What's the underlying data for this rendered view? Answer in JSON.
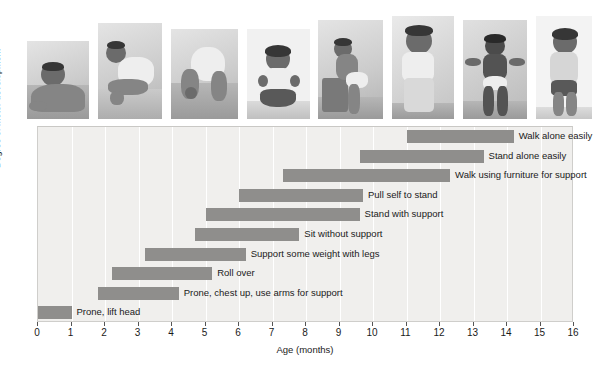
{
  "chart_data": {
    "type": "bar",
    "subtype": "horizontal-range-bar",
    "title": "",
    "xlabel": "Age (months)",
    "ylabel": "Degree of motor development",
    "xlim": [
      0,
      16
    ],
    "xticks": [
      0,
      1,
      2,
      3,
      4,
      5,
      6,
      7,
      8,
      9,
      10,
      11,
      12,
      13,
      14,
      15,
      16
    ],
    "grid": true,
    "legend": "none",
    "bar_color": "#8f8e8c",
    "plot_background": "#f0efed",
    "categories": [
      "Walk alone easily",
      "Stand alone easily",
      "Walk using furniture for support",
      "Pull self to stand",
      "Stand with support",
      "Sit without support",
      "Support some weight with legs",
      "Roll over",
      "Prone, chest up, use arms for support",
      "Prone, lift head"
    ],
    "bars": [
      {
        "label": "Walk alone easily",
        "start": 11.0,
        "end": 14.2
      },
      {
        "label": "Stand alone easily",
        "start": 9.6,
        "end": 13.3
      },
      {
        "label": "Walk using furniture for support",
        "start": 7.3,
        "end": 12.3
      },
      {
        "label": "Pull self to stand",
        "start": 6.0,
        "end": 9.7
      },
      {
        "label": "Stand with support",
        "start": 5.0,
        "end": 9.6
      },
      {
        "label": "Sit without support",
        "start": 4.7,
        "end": 7.8
      },
      {
        "label": "Support some weight with legs",
        "start": 3.2,
        "end": 6.2
      },
      {
        "label": "Roll over",
        "start": 2.2,
        "end": 5.2
      },
      {
        "label": "Prone, chest up, use arms for support",
        "start": 1.8,
        "end": 4.2
      },
      {
        "label": "Prone, lift head",
        "start": 0.0,
        "end": 1.0
      }
    ]
  },
  "photos": [
    {
      "name": "photo-prone-lift-head",
      "caption": "Infant lying prone lifting head"
    },
    {
      "name": "photo-prone-chest-up",
      "caption": "Infant prone, chest up on arms"
    },
    {
      "name": "photo-crawling",
      "caption": "Infant on hands and knees"
    },
    {
      "name": "photo-sitting",
      "caption": "Infant sitting without support"
    },
    {
      "name": "photo-pull-to-stand",
      "caption": "Infant pulling self to stand at a box"
    },
    {
      "name": "photo-cruising",
      "caption": "Infant walking using furniture for support"
    },
    {
      "name": "photo-assisted-walking",
      "caption": "Infant walking with adult hands"
    },
    {
      "name": "photo-walking-alone",
      "caption": "Infant walking alone"
    }
  ]
}
